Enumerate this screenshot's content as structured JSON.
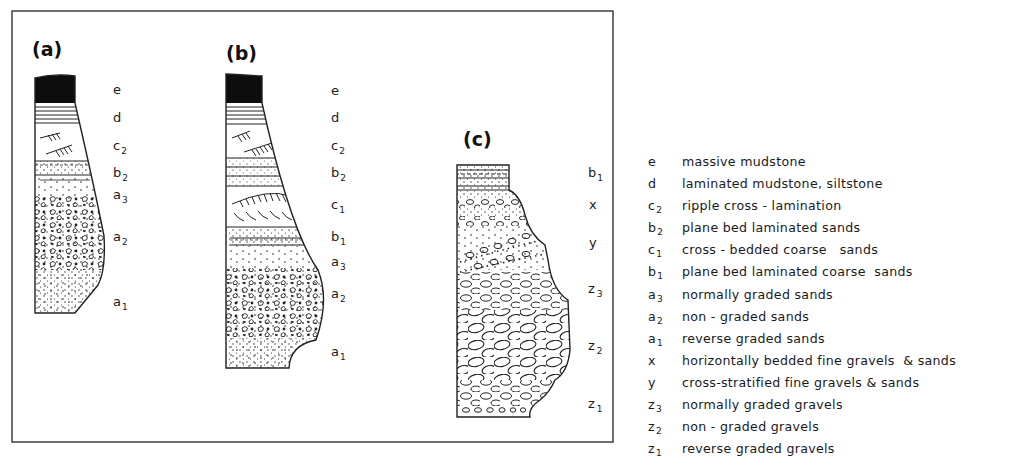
{
  "figure": {
    "panels": [
      {
        "id": "a",
        "label": "(a)",
        "layers": [
          {
            "code": "e",
            "sub": ""
          },
          {
            "code": "d",
            "sub": ""
          },
          {
            "code": "c",
            "sub": "2"
          },
          {
            "code": "b",
            "sub": "2"
          },
          {
            "code": "a",
            "sub": "3"
          },
          {
            "code": "a",
            "sub": "2"
          },
          {
            "code": "a",
            "sub": "1"
          }
        ]
      },
      {
        "id": "b",
        "label": "(b)",
        "layers": [
          {
            "code": "e",
            "sub": ""
          },
          {
            "code": "d",
            "sub": ""
          },
          {
            "code": "c",
            "sub": "2"
          },
          {
            "code": "b",
            "sub": "2"
          },
          {
            "code": "c",
            "sub": "1"
          },
          {
            "code": "b",
            "sub": "1"
          },
          {
            "code": "a",
            "sub": "3"
          },
          {
            "code": "a",
            "sub": "2"
          },
          {
            "code": "a",
            "sub": "1"
          }
        ]
      },
      {
        "id": "c",
        "label": "(c)",
        "layers": [
          {
            "code": "b",
            "sub": "1"
          },
          {
            "code": "x",
            "sub": ""
          },
          {
            "code": "y",
            "sub": ""
          },
          {
            "code": "z",
            "sub": "3"
          },
          {
            "code": "z",
            "sub": "2"
          },
          {
            "code": "z",
            "sub": "1"
          }
        ]
      }
    ]
  },
  "legend": {
    "items": [
      {
        "code": "e",
        "sub": "",
        "desc": "massive mudstone"
      },
      {
        "code": "d",
        "sub": "",
        "desc": "laminated mudstone, siltstone"
      },
      {
        "code": "c",
        "sub": "2",
        "desc": "ripple cross - lamination"
      },
      {
        "code": "b",
        "sub": "2",
        "desc": "plane bed laminated sands"
      },
      {
        "code": "c",
        "sub": "1",
        "desc": "cross - bedded coarse   sands"
      },
      {
        "code": "b",
        "sub": "1",
        "desc": "plane bed laminated coarse  sands"
      },
      {
        "code": "a",
        "sub": "3",
        "desc": "normally graded sands"
      },
      {
        "code": "a",
        "sub": "2",
        "desc": "non - graded sands"
      },
      {
        "code": "a",
        "sub": "1",
        "desc": "reverse graded sands"
      },
      {
        "code": "x",
        "sub": "",
        "desc": "horizontally bedded fine gravels  & sands"
      },
      {
        "code": "y",
        "sub": "",
        "desc": "cross-stratified fine gravels & sands"
      },
      {
        "code": "z",
        "sub": "3",
        "desc": "normally graded gravels"
      },
      {
        "code": "z",
        "sub": "2",
        "desc": "non - graded gravels"
      },
      {
        "code": "z",
        "sub": "1",
        "desc": "reverse graded gravels"
      }
    ]
  }
}
